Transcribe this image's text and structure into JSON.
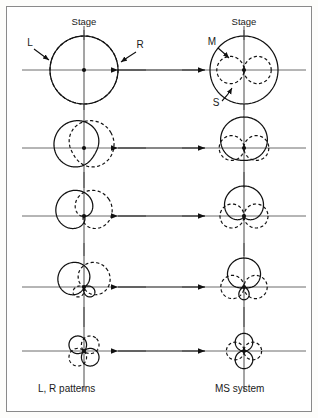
{
  "figure": {
    "title_left": "L, R patterns",
    "title_right": "MS system",
    "stage_label_left": "Stage",
    "stage_label_right": "Stage",
    "border_color": "#8a8a8a",
    "background_color": "#ffffff",
    "ink_color": "#111111",
    "axis_color": "#6d6d6d"
  },
  "callouts": {
    "left_channel": "L",
    "right_channel": "R",
    "mid_channel": "M",
    "side_channel": "S"
  },
  "columns": [
    {
      "id": "left",
      "caption": "L, R patterns",
      "stage": "Stage"
    },
    {
      "id": "right",
      "caption": "MS system",
      "stage": "Stage"
    }
  ],
  "chart_data": {
    "type": "line",
    "xlabel": "",
    "ylabel": "",
    "legend": [
      "L (solid)",
      "R (dashed)",
      "M (solid)",
      "S (dashed)"
    ],
    "rows": [
      {
        "index": 1,
        "left": {
          "curves": [
            {
              "name": "L",
              "style": "solid",
              "pattern": "omnidirectional",
              "directivity": 0.0,
              "aim_deg": -90
            },
            {
              "name": "R",
              "style": "dashed",
              "pattern": "omnidirectional",
              "directivity": 0.0,
              "aim_deg": 90
            }
          ]
        },
        "right": {
          "curves": [
            {
              "name": "M",
              "style": "solid",
              "pattern": "omnidirectional",
              "directivity": 0.0,
              "aim_deg": 0
            },
            {
              "name": "S",
              "style": "dashed",
              "pattern": "figure-8",
              "directivity": 1.0,
              "aim_deg": 90
            }
          ]
        }
      },
      {
        "index": 2,
        "left": {
          "curves": [
            {
              "name": "L",
              "style": "solid",
              "pattern": "wide cardioid",
              "directivity": 0.3,
              "aim_deg": -60
            },
            {
              "name": "R",
              "style": "dashed",
              "pattern": "wide cardioid",
              "directivity": 0.3,
              "aim_deg": 60
            }
          ]
        },
        "right": {
          "curves": [
            {
              "name": "M",
              "style": "solid",
              "pattern": "wide cardioid",
              "directivity": 0.3,
              "aim_deg": 0
            },
            {
              "name": "S",
              "style": "dashed",
              "pattern": "figure-8",
              "directivity": 1.0,
              "aim_deg": 90
            }
          ]
        }
      },
      {
        "index": 3,
        "left": {
          "curves": [
            {
              "name": "L",
              "style": "solid",
              "pattern": "cardioid",
              "directivity": 0.5,
              "aim_deg": -55
            },
            {
              "name": "R",
              "style": "dashed",
              "pattern": "cardioid",
              "directivity": 0.5,
              "aim_deg": 55
            }
          ]
        },
        "right": {
          "curves": [
            {
              "name": "M",
              "style": "solid",
              "pattern": "cardioid",
              "directivity": 0.5,
              "aim_deg": 0
            },
            {
              "name": "S",
              "style": "dashed",
              "pattern": "figure-8",
              "directivity": 1.0,
              "aim_deg": 90
            }
          ]
        }
      },
      {
        "index": 4,
        "left": {
          "curves": [
            {
              "name": "L",
              "style": "solid",
              "pattern": "hypercardioid",
              "directivity": 0.72,
              "aim_deg": -50
            },
            {
              "name": "R",
              "style": "dashed",
              "pattern": "hypercardioid",
              "directivity": 0.72,
              "aim_deg": 50
            }
          ]
        },
        "right": {
          "curves": [
            {
              "name": "M",
              "style": "solid",
              "pattern": "hypercardioid",
              "directivity": 0.72,
              "aim_deg": 0
            },
            {
              "name": "S",
              "style": "dashed",
              "pattern": "figure-8",
              "directivity": 1.0,
              "aim_deg": 90
            }
          ]
        }
      },
      {
        "index": 5,
        "left": {
          "curves": [
            {
              "name": "L",
              "style": "solid",
              "pattern": "figure-8",
              "directivity": 1.0,
              "aim_deg": -45
            },
            {
              "name": "R",
              "style": "dashed",
              "pattern": "figure-8",
              "directivity": 1.0,
              "aim_deg": 45
            }
          ]
        },
        "right": {
          "curves": [
            {
              "name": "M",
              "style": "solid",
              "pattern": "figure-8",
              "directivity": 1.0,
              "aim_deg": 0
            },
            {
              "name": "S",
              "style": "dashed",
              "pattern": "figure-8",
              "directivity": 1.0,
              "aim_deg": 90
            }
          ]
        }
      }
    ],
    "connectors": [
      {
        "row": 1,
        "type": "double-arrow"
      },
      {
        "row": 2,
        "type": "double-arrow"
      },
      {
        "row": 3,
        "type": "double-arrow"
      },
      {
        "row": 4,
        "type": "double-arrow"
      },
      {
        "row": 5,
        "type": "double-arrow"
      }
    ]
  }
}
